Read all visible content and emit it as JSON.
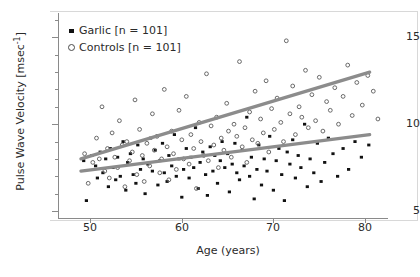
{
  "chart_data": {
    "type": "scatter",
    "title": "",
    "xlabel": "Age (years)",
    "ylabel": "Pulse Wave Velocity [msec⁻¹]",
    "xlim": [
      46.5,
      82.5
    ],
    "ylim": [
      4.6,
      16.4
    ],
    "xticks": [
      50,
      60,
      70,
      80
    ],
    "yticks": [
      5,
      10,
      15
    ],
    "yminorticks": [
      6,
      7,
      8,
      9,
      11,
      12,
      13,
      14,
      16
    ],
    "grid": false,
    "legend_position": "top-left",
    "series": [
      {
        "name": "Garlic [n = 101]",
        "label": "Garlic",
        "n": 101,
        "marker": "filled-square",
        "color": "#111111",
        "fit": {
          "x0": 49.0,
          "y0": 7.3,
          "x1": 80.5,
          "y1": 9.4,
          "color": "#8c8c8c"
        },
        "points": [
          [
            49.3,
            7.9
          ],
          [
            49.6,
            5.6
          ],
          [
            50.2,
            8.2
          ],
          [
            50.6,
            7.6
          ],
          [
            50.8,
            6.9
          ],
          [
            51.1,
            8.4
          ],
          [
            51.4,
            7.2
          ],
          [
            51.7,
            8.0
          ],
          [
            52.0,
            6.4
          ],
          [
            52.2,
            8.6
          ],
          [
            52.5,
            7.5
          ],
          [
            52.8,
            6.8
          ],
          [
            53.0,
            8.1
          ],
          [
            53.3,
            7.0
          ],
          [
            53.6,
            9.0
          ],
          [
            53.9,
            6.2
          ],
          [
            54.1,
            7.8
          ],
          [
            54.4,
            8.3
          ],
          [
            54.7,
            7.1
          ],
          [
            55.0,
            6.6
          ],
          [
            55.2,
            8.8
          ],
          [
            55.5,
            7.4
          ],
          [
            55.8,
            8.0
          ],
          [
            56.0,
            6.0
          ],
          [
            56.3,
            7.7
          ],
          [
            56.6,
            9.2
          ],
          [
            56.8,
            7.3
          ],
          [
            57.1,
            8.5
          ],
          [
            57.4,
            6.5
          ],
          [
            57.6,
            7.9
          ],
          [
            57.9,
            8.9
          ],
          [
            58.1,
            7.2
          ],
          [
            58.4,
            6.7
          ],
          [
            58.6,
            8.2
          ],
          [
            58.9,
            7.6
          ],
          [
            59.2,
            9.4
          ],
          [
            59.4,
            7.0
          ],
          [
            59.7,
            8.0
          ],
          [
            60.0,
            5.8
          ],
          [
            60.2,
            7.4
          ],
          [
            60.5,
            8.6
          ],
          [
            60.8,
            6.9
          ],
          [
            61.0,
            8.1
          ],
          [
            61.3,
            7.5
          ],
          [
            61.5,
            9.8
          ],
          [
            61.8,
            6.3
          ],
          [
            62.0,
            7.8
          ],
          [
            62.3,
            8.4
          ],
          [
            62.6,
            7.1
          ],
          [
            62.8,
            5.9
          ],
          [
            63.1,
            8.7
          ],
          [
            63.4,
            7.3
          ],
          [
            63.6,
            8.2
          ],
          [
            63.9,
            6.6
          ],
          [
            64.2,
            7.9
          ],
          [
            64.4,
            9.0
          ],
          [
            64.7,
            7.5
          ],
          [
            65.0,
            8.3
          ],
          [
            65.2,
            6.1
          ],
          [
            65.5,
            7.7
          ],
          [
            65.8,
            8.9
          ],
          [
            66.0,
            7.2
          ],
          [
            66.3,
            6.8
          ],
          [
            66.6,
            8.5
          ],
          [
            66.8,
            7.6
          ],
          [
            67.1,
            10.4
          ],
          [
            67.4,
            7.0
          ],
          [
            67.6,
            8.1
          ],
          [
            67.9,
            5.7
          ],
          [
            68.2,
            7.4
          ],
          [
            68.4,
            8.8
          ],
          [
            68.7,
            6.5
          ],
          [
            69.0,
            8.0
          ],
          [
            69.3,
            7.3
          ],
          [
            69.6,
            9.3
          ],
          [
            70.0,
            6.2
          ],
          [
            70.3,
            7.9
          ],
          [
            70.6,
            8.6
          ],
          [
            70.9,
            7.1
          ],
          [
            71.2,
            5.6
          ],
          [
            71.5,
            8.4
          ],
          [
            71.8,
            7.7
          ],
          [
            72.1,
            9.1
          ],
          [
            72.4,
            6.9
          ],
          [
            72.7,
            8.2
          ],
          [
            73.0,
            7.5
          ],
          [
            73.4,
            10.0
          ],
          [
            73.7,
            6.4
          ],
          [
            74.0,
            8.0
          ],
          [
            74.4,
            7.2
          ],
          [
            74.8,
            8.9
          ],
          [
            75.2,
            6.7
          ],
          [
            75.6,
            7.8
          ],
          [
            76.0,
            9.2
          ],
          [
            76.5,
            8.3
          ],
          [
            77.0,
            7.0
          ],
          [
            77.6,
            8.6
          ],
          [
            78.2,
            7.4
          ],
          [
            78.9,
            9.0
          ],
          [
            79.6,
            8.1
          ],
          [
            80.4,
            8.8
          ]
        ]
      },
      {
        "name": "Controls [n = 101]",
        "label": "Controls",
        "n": 101,
        "marker": "open-circle",
        "color": "#5a5a5a",
        "fit": {
          "x0": 49.0,
          "y0": 8.0,
          "x1": 80.5,
          "y1": 13.0,
          "color": "#8c8c8c"
        },
        "points": [
          [
            49.4,
            8.3
          ],
          [
            49.8,
            6.6
          ],
          [
            50.3,
            7.8
          ],
          [
            50.7,
            9.2
          ],
          [
            51.0,
            8.0
          ],
          [
            51.3,
            11.0
          ],
          [
            51.6,
            7.3
          ],
          [
            51.9,
            8.6
          ],
          [
            52.1,
            6.9
          ],
          [
            52.4,
            9.5
          ],
          [
            52.7,
            8.1
          ],
          [
            53.0,
            7.5
          ],
          [
            53.2,
            10.2
          ],
          [
            53.5,
            8.8
          ],
          [
            53.8,
            6.4
          ],
          [
            54.0,
            9.0
          ],
          [
            54.3,
            7.9
          ],
          [
            54.6,
            8.4
          ],
          [
            54.9,
            11.4
          ],
          [
            55.1,
            7.1
          ],
          [
            55.4,
            9.7
          ],
          [
            55.7,
            8.2
          ],
          [
            55.9,
            6.7
          ],
          [
            56.2,
            8.9
          ],
          [
            56.5,
            7.6
          ],
          [
            56.8,
            10.6
          ],
          [
            57.0,
            8.5
          ],
          [
            57.3,
            9.3
          ],
          [
            57.6,
            7.2
          ],
          [
            57.8,
            8.0
          ],
          [
            58.1,
            12.0
          ],
          [
            58.4,
            8.7
          ],
          [
            58.6,
            6.8
          ],
          [
            58.9,
            9.6
          ],
          [
            59.1,
            8.3
          ],
          [
            59.4,
            7.4
          ],
          [
            59.7,
            10.8
          ],
          [
            60.0,
            9.1
          ],
          [
            60.2,
            8.0
          ],
          [
            60.5,
            11.6
          ],
          [
            60.8,
            7.7
          ],
          [
            61.0,
            9.4
          ],
          [
            61.3,
            8.6
          ],
          [
            61.6,
            6.3
          ],
          [
            61.9,
            10.1
          ],
          [
            62.1,
            9.0
          ],
          [
            62.4,
            8.2
          ],
          [
            62.7,
            12.9
          ],
          [
            62.9,
            7.9
          ],
          [
            63.2,
            9.9
          ],
          [
            63.5,
            8.8
          ],
          [
            63.8,
            10.4
          ],
          [
            64.0,
            7.5
          ],
          [
            64.3,
            9.2
          ],
          [
            64.6,
            8.5
          ],
          [
            64.9,
            11.2
          ],
          [
            65.1,
            9.6
          ],
          [
            65.4,
            8.1
          ],
          [
            65.7,
            10.0
          ],
          [
            66.0,
            9.3
          ],
          [
            66.3,
            13.6
          ],
          [
            66.6,
            8.7
          ],
          [
            66.9,
            9.8
          ],
          [
            67.1,
            7.8
          ],
          [
            67.4,
            10.7
          ],
          [
            67.7,
            9.1
          ],
          [
            68.0,
            11.9
          ],
          [
            68.3,
            8.9
          ],
          [
            68.6,
            10.3
          ],
          [
            68.9,
            9.5
          ],
          [
            69.2,
            12.5
          ],
          [
            69.5,
            8.4
          ],
          [
            69.8,
            10.9
          ],
          [
            70.1,
            9.7
          ],
          [
            70.4,
            11.5
          ],
          [
            70.8,
            10.1
          ],
          [
            71.1,
            9.0
          ],
          [
            71.4,
            14.8
          ],
          [
            71.8,
            10.6
          ],
          [
            72.1,
            12.2
          ],
          [
            72.4,
            9.4
          ],
          [
            72.8,
            11.0
          ],
          [
            73.1,
            10.4
          ],
          [
            73.5,
            13.1
          ],
          [
            73.8,
            9.8
          ],
          [
            74.2,
            11.7
          ],
          [
            74.6,
            10.2
          ],
          [
            75.0,
            12.7
          ],
          [
            75.4,
            9.6
          ],
          [
            75.8,
            11.3
          ],
          [
            76.2,
            10.8
          ],
          [
            76.7,
            12.1
          ],
          [
            77.1,
            10.0
          ],
          [
            77.6,
            11.6
          ],
          [
            78.1,
            13.4
          ],
          [
            78.6,
            10.5
          ],
          [
            79.1,
            12.4
          ],
          [
            79.7,
            11.1
          ],
          [
            80.3,
            12.8
          ],
          [
            80.9,
            11.9
          ],
          [
            81.4,
            10.3
          ]
        ]
      }
    ]
  },
  "axes": {
    "y_title_main": "Pulse Wave Velocity [msec",
    "y_title_sup": "-1",
    "y_title_end": "]",
    "x_title": "Age (years)",
    "ytick_labels": [
      "15",
      "10",
      "5"
    ],
    "xtick_labels": [
      "50",
      "60",
      "70",
      "80"
    ]
  },
  "legend": {
    "items": [
      {
        "label": "Garlic [n = 101]",
        "marker": "filled-square"
      },
      {
        "label": "Controls [n = 101]",
        "marker": "open-circle"
      }
    ]
  }
}
